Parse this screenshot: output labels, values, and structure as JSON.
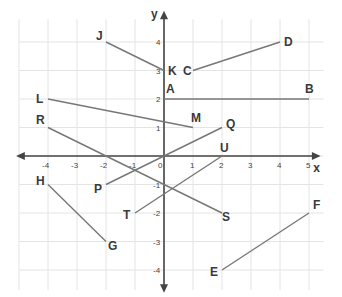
{
  "chart_data": {
    "type": "line",
    "title": "",
    "xlabel": "x",
    "ylabel": "y",
    "xlim": [
      -5,
      5
    ],
    "ylim": [
      -4,
      4
    ],
    "grid": true,
    "x_ticks": [
      "-4",
      "-3",
      "-2",
      "-1",
      "0",
      "1",
      "2",
      "3",
      "4",
      "5"
    ],
    "y_ticks": [
      "4",
      "3",
      "2",
      "1",
      "-1",
      "-2",
      "-3",
      "-4"
    ],
    "segments": [
      {
        "name": "JK",
        "p1": {
          "label": "J",
          "x": -2,
          "y": 4
        },
        "p2": {
          "label": "K",
          "x": 0,
          "y": 3
        }
      },
      {
        "name": "CD",
        "p1": {
          "label": "C",
          "x": 1,
          "y": 3
        },
        "p2": {
          "label": "D",
          "x": 4,
          "y": 4
        }
      },
      {
        "name": "AB",
        "p1": {
          "label": "A",
          "x": 0,
          "y": 2
        },
        "p2": {
          "label": "B",
          "x": 5,
          "y": 2
        }
      },
      {
        "name": "LM",
        "p1": {
          "label": "L",
          "x": -4,
          "y": 2
        },
        "p2": {
          "label": "M",
          "x": 1,
          "y": 1
        }
      },
      {
        "name": "RS",
        "p1": {
          "label": "R",
          "x": -4,
          "y": 1
        },
        "p2": {
          "label": "S",
          "x": 2,
          "y": -2
        }
      },
      {
        "name": "PQ",
        "p1": {
          "label": "P",
          "x": -2,
          "y": -1
        },
        "p2": {
          "label": "Q",
          "x": 2,
          "y": 1
        }
      },
      {
        "name": "TU",
        "p1": {
          "label": "T",
          "x": -1,
          "y": -2
        },
        "p2": {
          "label": "U",
          "x": 2,
          "y": 0
        }
      },
      {
        "name": "HG",
        "p1": {
          "label": "H",
          "x": -4,
          "y": -1
        },
        "p2": {
          "label": "G",
          "x": -2,
          "y": -3
        }
      },
      {
        "name": "EF",
        "p1": {
          "label": "E",
          "x": 2,
          "y": -4
        },
        "p2": {
          "label": "F",
          "x": 5,
          "y": -2
        }
      }
    ]
  },
  "colors": {
    "segment": "#777777",
    "axis": "#444444",
    "grid": "#e4e4e4",
    "label": "#3a3a3a"
  }
}
